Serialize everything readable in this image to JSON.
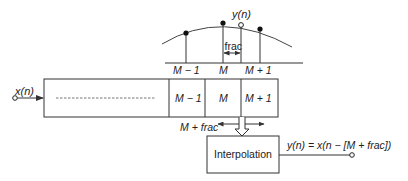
{
  "diagram": {
    "type": "fractional-delay-line",
    "colors": {
      "stroke": "#333333",
      "text": "#222222",
      "background": "#ffffff"
    },
    "plot": {
      "output_sample_label": "y(n)",
      "frac_label": "frac",
      "axis_labels": [
        "M − 1",
        "M",
        "M + 1"
      ]
    },
    "input": {
      "label": "x(n)"
    },
    "delay_line": {
      "cells": [
        "M − 1",
        "M",
        "M + 1"
      ]
    },
    "read_pointer": {
      "label": "M + frac"
    },
    "interpolation": {
      "label": "Interpolation"
    },
    "output": {
      "equation": "y(n) = x(n − [M + frac])"
    }
  }
}
